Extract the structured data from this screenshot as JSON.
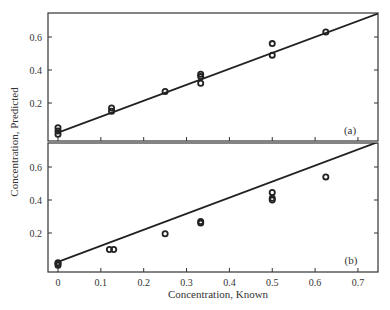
{
  "chart_data": [
    {
      "type": "scatter",
      "panel_label": "(a)",
      "xlabel": "",
      "ylabel": "Concentration, Predicted",
      "xlim": [
        -0.02,
        0.75
      ],
      "ylim": [
        0,
        0.75
      ],
      "x_ticks": [
        0,
        0.1,
        0.2,
        0.3,
        0.4,
        0.5,
        0.6,
        0.7
      ],
      "y_ticks": [
        0.2,
        0.4,
        0.6
      ],
      "y_tick_labels": [
        "0.2",
        "0.4",
        "0.6"
      ],
      "grid": false,
      "series": [
        {
          "name": "samples",
          "marker": "open-circle",
          "points": [
            {
              "x": 0,
              "y": 0.01
            },
            {
              "x": 0,
              "y": 0.03
            },
            {
              "x": 0,
              "y": 0.05
            },
            {
              "x": 0.125,
              "y": 0.15
            },
            {
              "x": 0.125,
              "y": 0.17
            },
            {
              "x": 0.25,
              "y": 0.27
            },
            {
              "x": 0.333,
              "y": 0.32
            },
            {
              "x": 0.333,
              "y": 0.36
            },
            {
              "x": 0.333,
              "y": 0.375
            },
            {
              "x": 0.5,
              "y": 0.49
            },
            {
              "x": 0.5,
              "y": 0.56
            },
            {
              "x": 0.625,
              "y": 0.63
            }
          ]
        },
        {
          "name": "fit",
          "type": "line",
          "points": [
            {
              "x": 0,
              "y": 0.02
            },
            {
              "x": 0.75,
              "y": 0.745
            }
          ]
        }
      ]
    },
    {
      "type": "scatter",
      "panel_label": "(b)",
      "xlabel": "Concentration, Known",
      "ylabel": "Concentration, Predicted",
      "xlim": [
        -0.02,
        0.75
      ],
      "ylim": [
        -0.01,
        0.74
      ],
      "x_ticks": [
        0,
        0.1,
        0.2,
        0.3,
        0.4,
        0.5,
        0.6,
        0.7
      ],
      "x_tick_labels": [
        "0",
        "0.1",
        "0.2",
        "0.3",
        "0.4",
        "0.5",
        "0.6",
        "0.7"
      ],
      "y_ticks": [
        0.2,
        0.4,
        0.6
      ],
      "y_tick_labels": [
        "0.2",
        "0.4",
        "0.6"
      ],
      "grid": false,
      "series": [
        {
          "name": "samples",
          "marker": "open-circle",
          "points": [
            {
              "x": 0,
              "y": 0.005
            },
            {
              "x": 0,
              "y": 0.015
            },
            {
              "x": 0,
              "y": 0.02
            },
            {
              "x": 0.12,
              "y": 0.1
            },
            {
              "x": 0.13,
              "y": 0.1
            },
            {
              "x": 0.25,
              "y": 0.195
            },
            {
              "x": 0.333,
              "y": 0.26
            },
            {
              "x": 0.333,
              "y": 0.27
            },
            {
              "x": 0.5,
              "y": 0.4
            },
            {
              "x": 0.5,
              "y": 0.41
            },
            {
              "x": 0.5,
              "y": 0.445
            },
            {
              "x": 0.625,
              "y": 0.54
            }
          ]
        },
        {
          "name": "fit",
          "type": "line",
          "points": [
            {
              "x": 0,
              "y": 0.025
            },
            {
              "x": 0.74,
              "y": 0.745
            }
          ]
        }
      ]
    }
  ],
  "labels": {
    "ylabel": "Concentration, Predicted",
    "xlabel": "Concentration, Known",
    "panel_a": "(a)",
    "panel_b": "(b)"
  }
}
